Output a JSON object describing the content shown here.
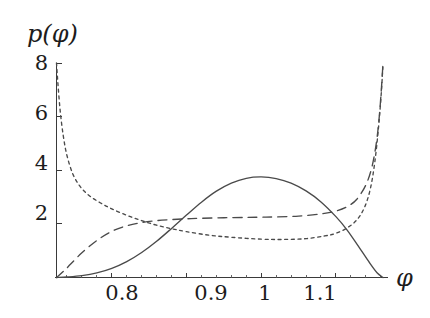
{
  "chart_data": {
    "type": "line",
    "title": "",
    "xlabel": "φ",
    "ylabel": "p(φ)",
    "xlim": [
      0.726,
      1.163
    ],
    "ylim": [
      0,
      8
    ],
    "grid": false,
    "legend": "none",
    "x_ticks": [
      {
        "value": 0.8,
        "label": "0.8"
      },
      {
        "value": 0.9,
        "label": "0.9"
      },
      {
        "value": 1.0,
        "label": "1"
      },
      {
        "value": 1.1,
        "label": "1.1"
      }
    ],
    "y_ticks": [
      {
        "value": 2,
        "label": "2"
      },
      {
        "value": 4,
        "label": "4"
      },
      {
        "value": 6,
        "label": "6"
      },
      {
        "value": 8,
        "label": "8"
      }
    ],
    "x_minor_ticks": [
      0.74,
      0.76,
      0.78,
      0.82,
      0.84,
      0.86,
      0.88,
      0.92,
      0.94,
      0.96,
      0.98,
      1.02,
      1.04,
      1.06,
      1.08,
      1.12,
      1.14,
      1.16
    ],
    "series": [
      {
        "name": "solid-curve",
        "style": "solid",
        "color": "#4a4a4a",
        "x": [
          0.726,
          0.74,
          0.76,
          0.78,
          0.8,
          0.82,
          0.84,
          0.86,
          0.88,
          0.9,
          0.92,
          0.94,
          0.96,
          0.98,
          1.0,
          1.02,
          1.04,
          1.06,
          1.08,
          1.1,
          1.115,
          1.13,
          1.145,
          1.155,
          1.163
        ],
        "y": [
          0.0,
          0.02,
          0.07,
          0.17,
          0.34,
          0.59,
          0.93,
          1.35,
          1.83,
          2.33,
          2.81,
          3.22,
          3.52,
          3.7,
          3.75,
          3.69,
          3.52,
          3.23,
          2.82,
          2.27,
          1.77,
          1.17,
          0.55,
          0.18,
          0.0
        ]
      },
      {
        "name": "dashed-curve",
        "style": "dashed",
        "color": "#4a4a4a",
        "x": [
          0.726,
          0.735,
          0.745,
          0.76,
          0.78,
          0.8,
          0.82,
          0.84,
          0.86,
          0.88,
          0.9,
          0.92,
          0.95,
          0.98,
          1.0,
          1.02,
          1.05,
          1.08,
          1.1,
          1.115,
          1.128,
          1.14,
          1.148,
          1.154,
          1.158,
          1.161,
          1.163
        ],
        "y": [
          0.0,
          0.22,
          0.5,
          0.92,
          1.38,
          1.72,
          1.93,
          2.05,
          2.12,
          2.16,
          2.19,
          2.21,
          2.23,
          2.24,
          2.25,
          2.26,
          2.29,
          2.37,
          2.48,
          2.64,
          2.92,
          3.45,
          4.1,
          5.0,
          6.0,
          7.1,
          8.0
        ]
      },
      {
        "name": "dotted-curve",
        "style": "dotted",
        "color": "#4a4a4a",
        "x": [
          0.726,
          0.728,
          0.731,
          0.735,
          0.74,
          0.748,
          0.758,
          0.77,
          0.785,
          0.8,
          0.82,
          0.84,
          0.86,
          0.88,
          0.9,
          0.93,
          0.96,
          1.0,
          1.03,
          1.06,
          1.085,
          1.1,
          1.115,
          1.128,
          1.138,
          1.146,
          1.152,
          1.157,
          1.161,
          1.163
        ],
        "y": [
          8.0,
          7.2,
          6.2,
          5.3,
          4.55,
          3.85,
          3.38,
          3.05,
          2.78,
          2.56,
          2.32,
          2.12,
          1.95,
          1.82,
          1.71,
          1.58,
          1.5,
          1.43,
          1.42,
          1.45,
          1.55,
          1.65,
          1.85,
          2.15,
          2.6,
          3.3,
          4.3,
          5.6,
          7.0,
          8.0
        ]
      }
    ]
  },
  "axes": {
    "y_axis_name": "p(φ)",
    "x_axis_name": "φ"
  }
}
